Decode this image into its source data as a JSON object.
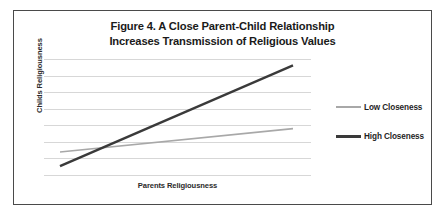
{
  "figure": {
    "title_line1_prefix": "Figure 4.",
    "title_line1_rest": " A Close Parent-Child Relationship",
    "title_line2": "Increases Transmission of Religious Values"
  },
  "chart_data": {
    "type": "line",
    "title": "Figure 4. A Close Parent-Child Relationship Increases Transmission of Religious Values",
    "xlabel": "Parents Religiousness",
    "ylabel": "Childs Religiousness",
    "x": [
      0,
      1
    ],
    "xlim": [
      0,
      1
    ],
    "ylim": [
      0,
      1
    ],
    "grid": true,
    "gridlines": 8,
    "axis_ticks": false,
    "legend_position": "right",
    "series": [
      {
        "name": "Low Closeness",
        "color": "#a8a8a8",
        "width": 1.6,
        "values": [
          0.205,
          0.405
        ]
      },
      {
        "name": "High Closeness",
        "color": "#3a3a3a",
        "width": 2.4,
        "values": [
          0.085,
          0.945
        ]
      }
    ],
    "annotations": []
  },
  "legend": {
    "items": [
      {
        "label": "Low Closeness",
        "swatch": "low-closeness-line-swatch"
      },
      {
        "label": "High Closeness",
        "swatch": "high-closeness-line-swatch"
      }
    ]
  }
}
